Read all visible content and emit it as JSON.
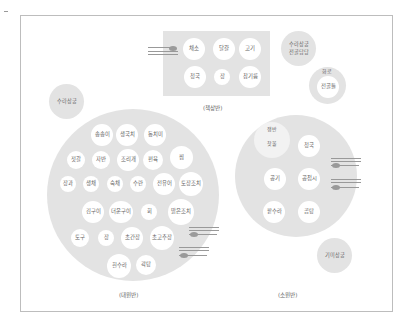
{
  "colors": {
    "table": "#e3e3e3",
    "dish": "#ffffff",
    "frame": "#bdbdbd",
    "utensil": "#9a9a9a"
  },
  "chaeksangban": {
    "label": "(책상반)",
    "dishes": [
      "채소",
      "달걀",
      "고기",
      "청국",
      "장",
      "참기름"
    ]
  },
  "side_top_right": {
    "line1": "수라상궁",
    "line2": "전골담당"
  },
  "hwaro": {
    "label": "화로",
    "inner": "전골틀"
  },
  "side_left": {
    "text": "수라상궁"
  },
  "daewonban": {
    "label": "(대원반)",
    "rows": [
      [
        "송송이",
        "생국치",
        "동치미"
      ],
      [
        "젓갈",
        "자반",
        "조리개",
        "편육",
        "찜"
      ],
      [
        "장과",
        "생채",
        "숙채",
        "수란",
        "전유어",
        "토장조치"
      ],
      [
        "김구이",
        "더운구이",
        "회",
        "맑은조치"
      ],
      [
        "토구",
        "장",
        "초간장",
        "초고추장"
      ],
      [
        "흰수라",
        "곽탕"
      ]
    ]
  },
  "sowonban": {
    "label": "(소원반)",
    "tray_label": "쟁반",
    "tray_item": "찻물",
    "dishes": [
      "청국",
      "공기",
      "공접시",
      "팥수라",
      "곰탕"
    ]
  },
  "side_bottom_right": {
    "text": "기미상궁"
  },
  "icons": {
    "utensil": "spoon-and-chopsticks-icon"
  }
}
